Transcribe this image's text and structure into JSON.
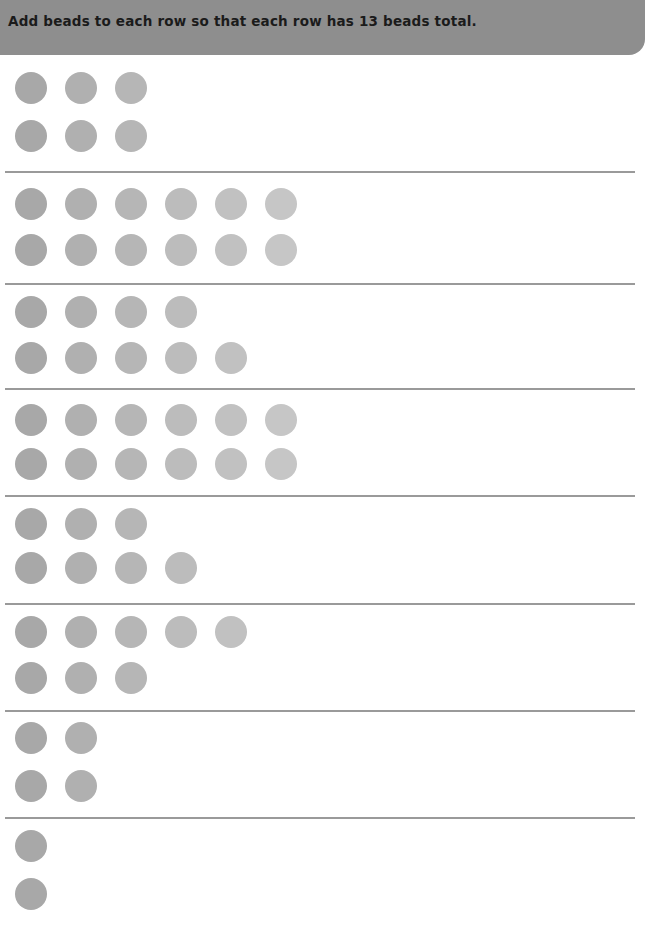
{
  "header": {
    "instruction": "Add beads to each row so that each row has 13 beads total.",
    "background_color": "#8e8e8e",
    "text_color": "#1b1b1b"
  },
  "page": {
    "background_color": "#ffffff",
    "divider_color": "#9a9a9a",
    "target_count": 13
  },
  "bead": {
    "diameter_px": 32,
    "pitch_px": 50,
    "first_center_x_px": 31,
    "colors": [
      "#a8a8a8",
      "#b0b0b0",
      "#b6b6b6",
      "#bcbcbc",
      "#c1c1c1",
      "#c6c6c6"
    ]
  },
  "groups": [
    {
      "index": 1,
      "top_row_count": 3,
      "bottom_row_count": 3,
      "top_y": 72,
      "bottom_y": 120,
      "divider_y": 171
    },
    {
      "index": 2,
      "top_row_count": 6,
      "bottom_row_count": 6,
      "top_y": 188,
      "bottom_y": 234,
      "divider_y": 283
    },
    {
      "index": 3,
      "top_row_count": 4,
      "bottom_row_count": 5,
      "top_y": 296,
      "bottom_y": 342,
      "divider_y": 388
    },
    {
      "index": 4,
      "top_row_count": 6,
      "bottom_row_count": 6,
      "top_y": 404,
      "bottom_y": 448,
      "divider_y": 495
    },
    {
      "index": 5,
      "top_row_count": 3,
      "bottom_row_count": 4,
      "top_y": 508,
      "bottom_y": 552,
      "divider_y": 603
    },
    {
      "index": 6,
      "top_row_count": 5,
      "bottom_row_count": 3,
      "top_y": 616,
      "bottom_y": 662,
      "divider_y": 710
    },
    {
      "index": 7,
      "top_row_count": 2,
      "bottom_row_count": 2,
      "top_y": 722,
      "bottom_y": 770,
      "divider_y": 817
    },
    {
      "index": 8,
      "top_row_count": 1,
      "bottom_row_count": 1,
      "top_y": 830,
      "bottom_y": 878,
      "divider_y": null
    }
  ]
}
